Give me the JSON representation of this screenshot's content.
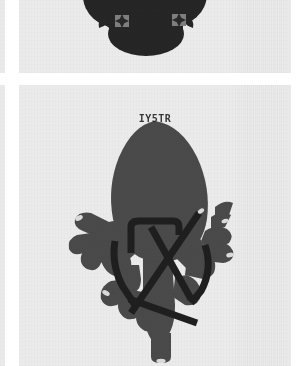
{
  "page": {
    "background_color": "#ffffff",
    "panel_color": "#ebebeb"
  },
  "panels": [
    {
      "name": "top-panel-crop",
      "caption": ""
    },
    {
      "name": "main-panel",
      "caption": "IY5TR"
    }
  ],
  "figures": {
    "top": {
      "name": "cropped-organ-figure",
      "shape_color": "#262626",
      "marker_color": "#8c8c8c",
      "marker_count": 2,
      "description": "cropped dark lobed organ silhouette with two star markers"
    },
    "main": {
      "name": "heart-organ-figure",
      "body_color": "#4a4a4a",
      "vessel_color": "#1f1f1f",
      "highlight_color": "#d8d8d8",
      "description": "dark grey heart-shaped organ with branching vascular root structures and overlaid dark vessel tubes"
    }
  },
  "label": {
    "text": "IY5TR",
    "color": "#2c2c2c"
  }
}
